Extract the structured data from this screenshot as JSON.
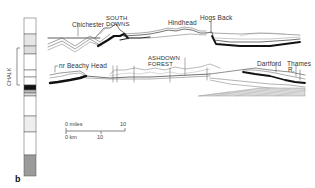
{
  "figure": {
    "panel_letter": "b",
    "column": {
      "label": "CHALK",
      "units": [
        {
          "y0": 18,
          "y1": 34,
          "fill": "#ffffff"
        },
        {
          "y0": 34,
          "y1": 46,
          "fill": "#e6e6e6"
        },
        {
          "y0": 46,
          "y1": 54,
          "fill": "#dedede"
        },
        {
          "y0": 54,
          "y1": 70,
          "fill": "#ffffff"
        },
        {
          "y0": 70,
          "y1": 77,
          "fill": "#ffffff"
        },
        {
          "y0": 77,
          "y1": 85,
          "fill": "#ffffff"
        },
        {
          "y0": 85,
          "y1": 90,
          "fill": "#111111"
        },
        {
          "y0": 90,
          "y1": 93,
          "fill": "#bbbbbb"
        },
        {
          "y0": 93,
          "y1": 96,
          "fill": "#dddddd"
        },
        {
          "y0": 96,
          "y1": 116,
          "fill": "#ffffff"
        },
        {
          "y0": 116,
          "y1": 132,
          "fill": "#eeeeee"
        },
        {
          "y0": 132,
          "y1": 155,
          "fill": "#ffffff"
        },
        {
          "y0": 155,
          "y1": 176,
          "fill": "#9a9a9a"
        }
      ]
    },
    "upper_section": {
      "labels": [
        {
          "text": "Chichester",
          "x": 72,
          "y": 22
        },
        {
          "text": "SOUTH",
          "x": 106,
          "y": 16
        },
        {
          "text": "DOWNS",
          "x": 106,
          "y": 22
        },
        {
          "text": "Hindhead",
          "x": 168,
          "y": 20
        },
        {
          "text": "Hogs Back",
          "x": 200,
          "y": 15
        }
      ]
    },
    "lower_section": {
      "labels": [
        {
          "text": "nr Beachy Head",
          "x": 59,
          "y": 63
        },
        {
          "text": "ASHDOWN",
          "x": 148,
          "y": 56
        },
        {
          "text": "FOREST",
          "x": 148,
          "y": 62
        },
        {
          "text": "Dartford",
          "x": 257,
          "y": 61
        },
        {
          "text": "Thames",
          "x": 287,
          "y": 61
        },
        {
          "text": "R.",
          "x": 288,
          "y": 67
        }
      ]
    },
    "scale_bar": {
      "miles_label": "0 miles",
      "miles_end": "10",
      "km_label": "0 km",
      "km_mid": "10"
    }
  }
}
